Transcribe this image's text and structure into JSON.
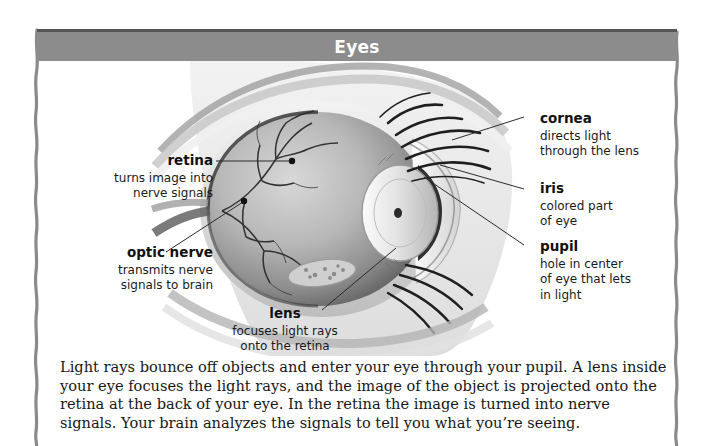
{
  "banner": {
    "title": "Eyes",
    "background_color": "#8c8c8c",
    "edge_color": "#565656",
    "text_color": "#ffffff"
  },
  "illustration": {
    "name": "eye-cross-section-diagram",
    "description": "Grayscale anatomical cross-section of a human eye showing eyeball, retina blood vessels, lens, iris, cornea and eyelashes"
  },
  "callouts": [
    {
      "id": "retina",
      "title": "retina",
      "desc_lines": [
        "turns image into",
        "nerve signals"
      ],
      "align": "right"
    },
    {
      "id": "optic-nerve",
      "title": "optic nerve",
      "desc_lines": [
        "transmits nerve",
        "signals to brain"
      ],
      "align": "right"
    },
    {
      "id": "lens",
      "title": "lens",
      "desc_lines": [
        "focuses light rays",
        "onto the retina"
      ],
      "align": "center"
    },
    {
      "id": "cornea",
      "title": "cornea",
      "desc_lines": [
        "directs light",
        "through the lens"
      ],
      "align": "left"
    },
    {
      "id": "iris",
      "title": "iris",
      "desc_lines": [
        "colored part",
        "of eye"
      ],
      "align": "left"
    },
    {
      "id": "pupil",
      "title": "pupil",
      "desc_lines": [
        "hole in center",
        "of eye that lets",
        "in light"
      ],
      "align": "left"
    }
  ],
  "body": {
    "paragraph": "Light rays bounce off objects and enter your eye through your pupil. A lens inside your eye focuses the light rays, and the image of the object is projected onto the retina at the back of your eye. In the retina the image is turned into nerve signals. Your brain analyzes the signals to tell you what you’re seeing."
  }
}
